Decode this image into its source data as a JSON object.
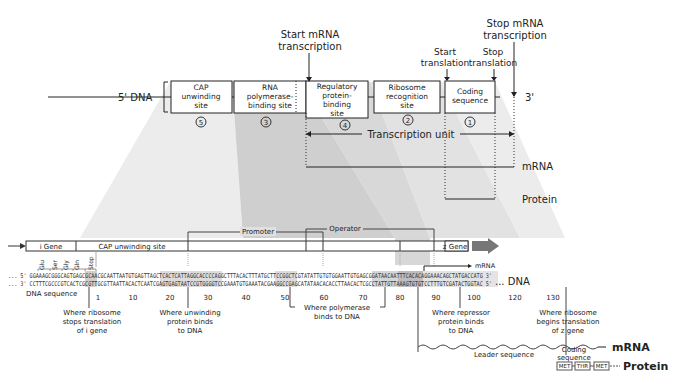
{
  "top_diagram": {
    "five_prime_label": "5' DNA",
    "three_prime_label": "3'",
    "boxes": [
      {
        "lines": [
          "CAP",
          "unwinding",
          "site"
        ],
        "number": "5"
      },
      {
        "lines": [
          "RNA",
          "polymerase-",
          "binding site"
        ],
        "number": "3"
      },
      {
        "lines": [
          "Regulatory",
          "protein-",
          "binding",
          "site"
        ],
        "number": "4"
      },
      {
        "lines": [
          "Ribosome",
          "recognition",
          "site"
        ],
        "number": "2"
      },
      {
        "lines": [
          "Coding",
          "sequence"
        ],
        "number": "1"
      }
    ],
    "start_mrna": [
      "Start mRNA",
      "transcription"
    ],
    "stop_mrna": [
      "Stop mRNA",
      "transcription"
    ],
    "start_translation": [
      "Start",
      "translation"
    ],
    "stop_translation": [
      "Stop",
      "translation"
    ],
    "transcription_unit": "Transcription unit",
    "mrna_label": "mRNA",
    "protein_label": "Protein"
  },
  "gene_bar": {
    "i_gene": "i Gene",
    "cap_site": "CAP unwinding site",
    "promoter": "Promoter",
    "operator": "Operator",
    "z_gene": "z Gene"
  },
  "sequence": {
    "codons": [
      "Glu",
      "Ser",
      "Gly",
      "Gln",
      "Stop"
    ],
    "strand_top": "... 5' GGAAAGCGGGCAGTGAGCGCAACGCAATTAATGTGAGTTAGCTCACTCATTAGGCACCCCAGGCTTTACACTTTATGCTTCCGGCTCGTATATTGTGTGGAATTGTGAGCGGATAACAATTTCACACAGGAAACAGCTATGACCATG 3'",
    "strand_bottom": "... 3' CCTTTCGCCCGTCACTCGCGTTGCGTTAATTACACTCAATCGAGTGAGTAATCCGTGGGGTCCGAAATGTGAAATACGAAGGCCGAGCATATAACACACCTTAACACTCGCCTATTGTTAAAGTGTGTCCTTTGTCGATACTGGTAC 5'",
    "dna_label": "... DNA",
    "dna_sequence_label": "DNA sequence",
    "mrna_start_label": "mRNA",
    "ticks": [
      "1",
      "10",
      "20",
      "30",
      "40",
      "50",
      "60",
      "70",
      "80",
      "90",
      "100",
      "120",
      "130"
    ]
  },
  "annotations": {
    "ribosome_stops": [
      "Where ribosome",
      "stops translation",
      "of i gene"
    ],
    "unwinding_binds": [
      "Where unwinding",
      "protein binds",
      "to DNA"
    ],
    "polymerase_binds": [
      "Where polymerase",
      "binds to DNA"
    ],
    "repressor_binds": [
      "Where repressor",
      "protein binds",
      "to DNA"
    ],
    "ribosome_begins": [
      "Where ribosome",
      "begins translation",
      "of z gene"
    ]
  },
  "products": {
    "leader_sequence": "Leader sequence",
    "coding_sequence": [
      "Coding",
      "sequence"
    ],
    "mrna": "mRNA",
    "protein": "Protein",
    "amino_acids": [
      "MET",
      "THR",
      "MET"
    ]
  }
}
